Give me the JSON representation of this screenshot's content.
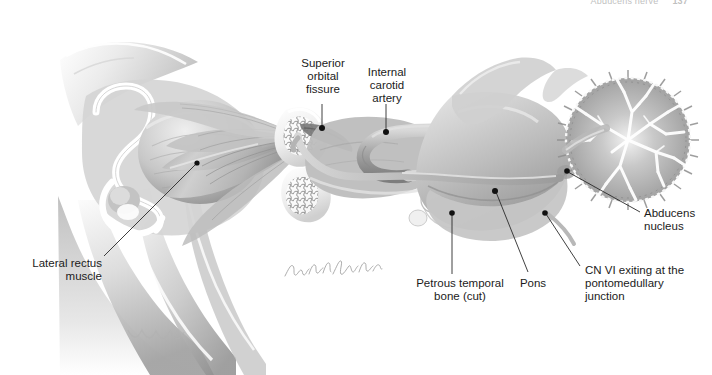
{
  "page": {
    "running_head": "Abducens nerve",
    "page_number": "137",
    "background_color": "#ffffff",
    "ink_color": "#1b1b1b",
    "illustration_title": "Course of the abducens nerve (CN VI) from the pontomedullary junction to the lateral rectus muscle",
    "style": "grayscale medical illustration, lateral sagittal view"
  },
  "signature": {
    "artist_mark": "handwritten artist signature",
    "visible": true
  },
  "labels": {
    "superior_orbital_fissure": "Superior\norbital\nfissure",
    "internal_carotid_artery": "Internal\ncarotid\nartery",
    "lateral_rectus_muscle": "Lateral rectus\nmuscle",
    "petrous_temporal_bone": "Petrous temporal\nbone (cut)",
    "pons": "Pons",
    "cn_vi_exiting": "CN VI exiting at the\npontomedullary\njunction",
    "abducens_nucleus": "Abducens\nnucleus"
  },
  "structures": [
    {
      "name": "eye-globe",
      "region": "orbit",
      "shade": "#c9c9c9"
    },
    {
      "name": "lateral-rectus-muscle",
      "region": "orbit",
      "shade": "#bdbdbd"
    },
    {
      "name": "orbital-bone-rim",
      "region": "orbit",
      "shade": "#efefef"
    },
    {
      "name": "superior-orbital-fissure",
      "region": "skull-base",
      "shade": "#7a7a7a"
    },
    {
      "name": "internal-carotid-artery",
      "region": "cavernous-sinus",
      "shade": "#9a9a9a"
    },
    {
      "name": "sphenoid-bone",
      "region": "skull-base",
      "shade": "#e4e4e4"
    },
    {
      "name": "petrous-temporal-bone",
      "region": "skull-base",
      "shade": "#f2f2f2"
    },
    {
      "name": "abducens-nerve",
      "region": "brainstem",
      "shade": "#b2b2b2"
    },
    {
      "name": "pons",
      "region": "brainstem",
      "shade": "#b8b8b8"
    },
    {
      "name": "medulla",
      "region": "brainstem",
      "shade": "#c0c0c0"
    },
    {
      "name": "abducens-nucleus",
      "region": "brainstem",
      "shade": "#8e8e8e"
    },
    {
      "name": "cerebellum",
      "region": "posterior-fossa",
      "shade": "#a8a8a8"
    },
    {
      "name": "mandible-maxilla",
      "region": "facial-skeleton",
      "shade": "#d2d2d2"
    }
  ],
  "leader_lines": [
    {
      "target": "superior-orbital-fissure",
      "dot": true
    },
    {
      "target": "internal-carotid-artery",
      "dot": true
    },
    {
      "target": "lateral-rectus-muscle",
      "dot": true
    },
    {
      "target": "petrous-temporal-bone",
      "dot": true
    },
    {
      "target": "pons",
      "dot": true
    },
    {
      "target": "cn-vi-exiting",
      "dot": true
    },
    {
      "target": "abducens-nucleus",
      "dot": true
    }
  ]
}
